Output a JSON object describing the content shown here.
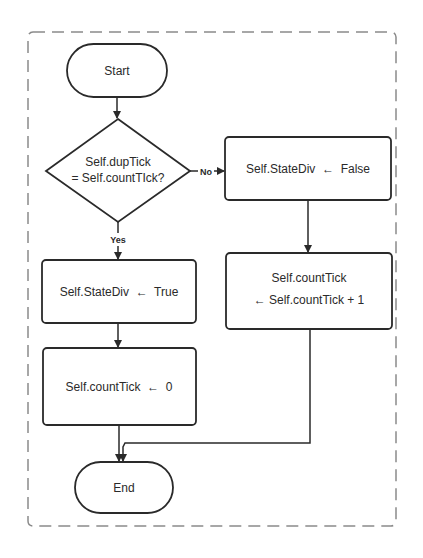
{
  "flowchart": {
    "start": {
      "label": "Start"
    },
    "decision": {
      "line1": "Self.dupTick",
      "line2": "= Self.countTIck?"
    },
    "branch_no": {
      "label": "No"
    },
    "branch_yes": {
      "label": "Yes"
    },
    "no_step1": {
      "label": "Self.StateDiv  ←  False"
    },
    "no_step2": {
      "line1": "Self.countTick",
      "line2": "← Self.countTick + 1"
    },
    "yes_step1": {
      "label": "Self.StateDiv  ←  True"
    },
    "yes_step2": {
      "label": "Self.countTick  ←  0"
    },
    "end": {
      "label": "End"
    }
  },
  "colors": {
    "stroke": "#2a2a2a",
    "dashed_border": "#8a8a8a",
    "background": "#ffffff"
  }
}
